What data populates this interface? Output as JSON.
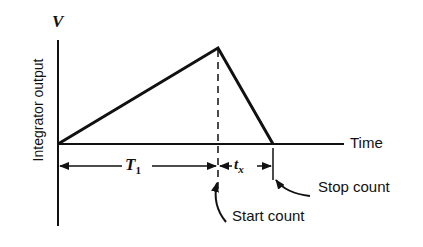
{
  "diagram": {
    "y_axis_symbol": "V",
    "y_axis_label": "Integrator output",
    "x_axis_label": "Time",
    "intervals": [
      {
        "id": "T1",
        "label": "T",
        "subscript": "1"
      },
      {
        "id": "tx",
        "label": "t",
        "subscript": "x"
      }
    ],
    "annotations": {
      "start": "Start count",
      "stop": "Stop count"
    },
    "waveform": {
      "description": "Dual-slope integrator: linear ramp up over T1, then linear ramp down over tx to zero",
      "points": [
        [
          0,
          0
        ],
        [
          1,
          1
        ],
        [
          1.34,
          0
        ]
      ]
    },
    "colors": {
      "line": "#111111",
      "background": "#ffffff"
    }
  }
}
